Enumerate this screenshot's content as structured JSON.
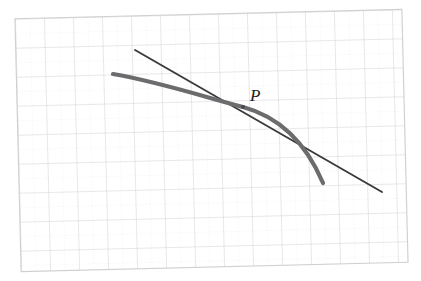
{
  "figure": {
    "background_color": "#ffffff",
    "width": 421,
    "height": 281
  },
  "grid": {
    "name": "graph-paper-grid",
    "major_line_color": "#d6d6d8",
    "minor_line_color": "#e8e8ea",
    "border_color": "#d0d0d2",
    "columns": 13,
    "rows": 9,
    "cell_size": 29,
    "minor_divisions": 2,
    "rotation_degrees": -1.4,
    "origin_x": 18,
    "origin_y": 14
  },
  "curve": {
    "name": "concave-curve",
    "color": "#6c6c6e",
    "stroke_width": 4.2,
    "start": [
      113,
      74
    ],
    "end": [
      323,
      183
    ],
    "control_points": [
      [
        185,
        92
      ],
      [
        262,
        118
      ],
      [
        306,
        152
      ]
    ],
    "path": "M 113 74 C 160 82 208 98 243 107 C 280 117 306 143 323 183"
  },
  "tangent": {
    "name": "tangent-line",
    "color": "#3a3a3c",
    "stroke_width": 1.9,
    "start": [
      135,
      50
    ],
    "end": [
      382,
      192
    ],
    "slope": -0.575
  },
  "point": {
    "name": "tangency-point-P",
    "label": "P",
    "x": 243,
    "y": 107,
    "marker_color": "#4a4a4c",
    "marker_radius": 2.1,
    "label_x": 250,
    "label_y": 101
  }
}
